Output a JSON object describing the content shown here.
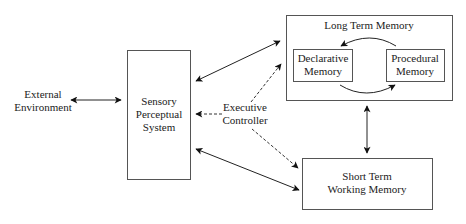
{
  "diagram": {
    "nodes": {
      "external": {
        "line1": "External",
        "line2": "Environment"
      },
      "sensory": {
        "line1": "Sensory",
        "line2": "Perceptual",
        "line3": "System"
      },
      "executive": {
        "line1": "Executive",
        "line2": "Controller"
      },
      "long_term": {
        "title": "Long Term Memory"
      },
      "declarative": {
        "line1": "Declarative",
        "line2": "Memory"
      },
      "procedural": {
        "line1": "Procedural",
        "line2": "Memory"
      },
      "short_term": {
        "line1": "Short Term",
        "line2": "Working Memory"
      }
    },
    "edges": [
      {
        "from": "External Environment",
        "to": "Sensory Perceptual System",
        "style": "solid",
        "direction": "bidirectional"
      },
      {
        "from": "Sensory Perceptual System",
        "to": "Long Term Memory",
        "style": "solid",
        "direction": "bidirectional"
      },
      {
        "from": "Sensory Perceptual System",
        "to": "Short Term Working Memory",
        "style": "solid",
        "direction": "bidirectional"
      },
      {
        "from": "Long Term Memory",
        "to": "Short Term Working Memory",
        "style": "solid",
        "direction": "bidirectional"
      },
      {
        "from": "Executive Controller",
        "to": "Sensory Perceptual System",
        "style": "dashed",
        "direction": "forward"
      },
      {
        "from": "Executive Controller",
        "to": "Long Term Memory",
        "style": "dashed",
        "direction": "forward"
      },
      {
        "from": "Executive Controller",
        "to": "Short Term Working Memory",
        "style": "dashed",
        "direction": "forward"
      },
      {
        "from": "Procedural Memory",
        "to": "Declarative Memory",
        "style": "solid-curved",
        "direction": "forward"
      },
      {
        "from": "Declarative Memory",
        "to": "Procedural Memory",
        "style": "solid-curved",
        "direction": "forward"
      }
    ]
  }
}
